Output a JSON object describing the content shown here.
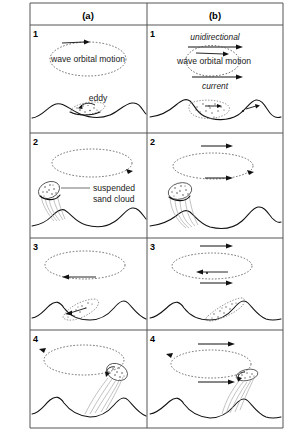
{
  "figure": {
    "columns": [
      {
        "id": "a",
        "label": "(a)",
        "caption": "oscillatory wave orbital motion only"
      },
      {
        "id": "b",
        "label": "(b)",
        "caption": "wave orbital motion combined with unidirectional current"
      }
    ],
    "row_numbers": [
      "1",
      "2",
      "3",
      "4"
    ],
    "labels": {
      "wave_orbital_motion": "wave orbital motion",
      "eddy": "eddy",
      "suspended_sand_cloud_line1": "suspended",
      "suspended_sand_cloud_line2": "sand cloud",
      "unidirectional": "unidirectional",
      "current": "current"
    },
    "panels": [
      {
        "row": "1",
        "column": "a",
        "texts": [
          "wave orbital motion",
          "eddy"
        ],
        "orbit": "closed elliptical orbit, arrow to the right at top",
        "bed": "symmetrical ripple profile",
        "sediment": "small eddy with entrained sand in lee of ripple crest"
      },
      {
        "row": "1",
        "column": "b",
        "texts": [
          "unidirectional",
          "wave orbital motion",
          "current"
        ],
        "orbit": "open looping orbit displaced to the right, arrow to the right",
        "bed": "asymmetric ripple profile",
        "sediment": "sand cloud hugging the ripple trough"
      },
      {
        "row": "2",
        "column": "a",
        "texts": [
          "suspended",
          "sand cloud"
        ],
        "orbit": "large dashed ellipse, arrow at right end",
        "bed": "ripple profile",
        "sediment": "suspended sand cloud lifted vertically off ripple crest"
      },
      {
        "row": "2",
        "column": "b",
        "texts": [],
        "orbit": "large dashed ellipse with straight current arrows above and through",
        "bed": "ripple profile",
        "sediment": "sand cloud lifted and bent downstream to the right"
      },
      {
        "row": "3",
        "column": "a",
        "texts": [],
        "orbit": "dashed ellipse with arrow pointing left (flow reversal)",
        "bed": "ripple profile",
        "sediment": "sand cloud settling back into the trough, dragged left"
      },
      {
        "row": "3",
        "column": "b",
        "texts": [],
        "orbit": "dashed ellipse with leftward inner arrow and rightward current arrows",
        "bed": "ripple profile",
        "sediment": "sand cloud settling on the stoss slope, displaced right"
      },
      {
        "row": "4",
        "column": "a",
        "texts": [],
        "orbit": "dashed ellipse with arrow at left end",
        "bed": "ripple profile",
        "sediment": "new sand cloud ejected up to the right of the crest"
      },
      {
        "row": "4",
        "column": "b",
        "texts": [],
        "orbit": "dashed ellipse with straight rightward current arrows",
        "bed": "ripple profile",
        "sediment": "new sand cloud ejected and swept further to the right"
      }
    ]
  }
}
